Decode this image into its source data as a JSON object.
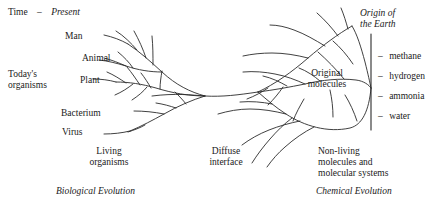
{
  "figure": {
    "type": "diagram"
  },
  "axis": {
    "time_label": "Time",
    "time_dash": "–",
    "present_label": "Present",
    "origin_label_line1": "Origin of",
    "origin_label_line2": "the Earth"
  },
  "left": {
    "todays_line1": "Today's",
    "todays_line2": "organisms",
    "branch_labels": [
      "Man",
      "Animal",
      "Plant",
      "Bacterium",
      "Virus"
    ],
    "group_line1": "Living",
    "group_line2": "organisms",
    "caption": "Biological Evolution"
  },
  "center": {
    "interface_line1": "Diffuse",
    "interface_line2": "interface"
  },
  "right": {
    "original_line1": "Original",
    "original_line2": "molecules",
    "group_line1": "Non-living",
    "group_line2": "molecules and",
    "group_line3": "molecular systems",
    "caption": "Chemical Evolution",
    "molecules": [
      "methane",
      "hydrogen",
      "ammonia",
      "water"
    ],
    "molecule_dash": "–"
  },
  "colors": {
    "ink": "#1a1a1a",
    "line": "#2b2b2b",
    "background": "#ffffff"
  }
}
